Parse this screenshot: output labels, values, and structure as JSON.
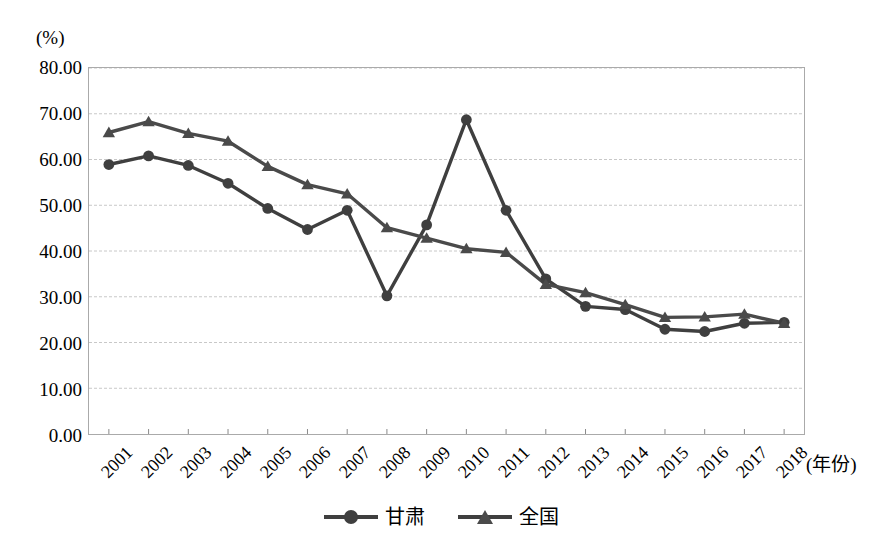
{
  "chart_data": {
    "type": "line",
    "title": "",
    "subtitle": "",
    "unit_label": "(%)",
    "xlabel": "(年份)",
    "ylabel": "",
    "ylim": [
      0,
      80
    ],
    "ytick_step": 10,
    "yticks": [
      "0.00",
      "10.00",
      "20.00",
      "30.00",
      "40.00",
      "50.00",
      "60.00",
      "70.00",
      "80.00"
    ],
    "ytick_values": [
      0,
      10,
      20,
      30,
      40,
      50,
      60,
      70,
      80
    ],
    "grid": true,
    "grid_axis": "y",
    "legend_position": "bottom",
    "categories": [
      "2001",
      "2002",
      "2003",
      "2004",
      "2005",
      "2006",
      "2007",
      "2008",
      "2009",
      "2010",
      "2011",
      "2012",
      "2013",
      "2014",
      "2015",
      "2016",
      "2017",
      "2018"
    ],
    "series": [
      {
        "name": "甘肃",
        "marker": "circle",
        "color": "#3f3f3f",
        "values": [
          58.9,
          60.8,
          58.7,
          54.8,
          49.3,
          44.7,
          48.9,
          30.2,
          45.7,
          68.7,
          48.9,
          33.9,
          27.9,
          27.2,
          22.9,
          22.4,
          24.2,
          24.4
        ]
      },
      {
        "name": "全国",
        "marker": "triangle",
        "color": "#4a4a4a",
        "values": [
          65.9,
          68.3,
          65.7,
          64.0,
          58.5,
          54.5,
          52.5,
          45.1,
          42.8,
          40.5,
          39.7,
          32.7,
          30.9,
          28.3,
          25.5,
          25.6,
          26.2,
          24.2
        ]
      }
    ]
  },
  "legend": {
    "items": [
      {
        "label": "甘肃",
        "marker": "circle"
      },
      {
        "label": "全国",
        "marker": "triangle"
      }
    ]
  }
}
